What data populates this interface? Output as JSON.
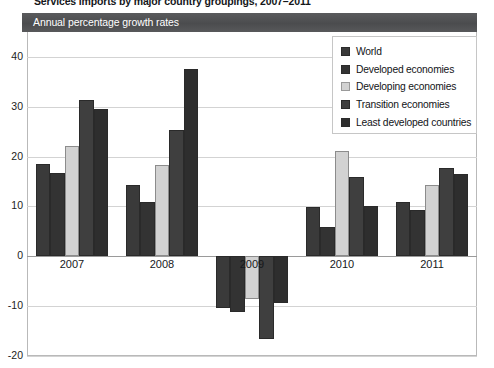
{
  "figure": {
    "caption": "Services imports by major country groupings, 2007–2011"
  },
  "panel": {
    "header_title": "Annual percentage growth rates",
    "header_color": "#4f5052"
  },
  "legend": {
    "position": "top-right",
    "entries": [
      {
        "label": "World",
        "color": "#3a3a3a",
        "swatch": "dark"
      },
      {
        "label": "Developed economies",
        "color": "#333333",
        "swatch": "dark"
      },
      {
        "label": "Developing economies",
        "color": "#d2d2d2",
        "swatch": "light"
      },
      {
        "label": "Transition economies",
        "color": "#3f3f3f",
        "swatch": "dark"
      },
      {
        "label": "Least developed countries",
        "color": "#2e2e2e",
        "swatch": "dark"
      }
    ]
  },
  "axes": {
    "y_ticks": [
      "40",
      "30",
      "20",
      "10",
      "0",
      "-10",
      "-20"
    ],
    "y_values": [
      40,
      30,
      20,
      10,
      0,
      -10,
      -20
    ],
    "x_ticks": [
      "2007",
      "2008",
      "2009",
      "2010",
      "2011"
    ]
  },
  "chart_data": {
    "type": "bar",
    "title": "Annual percentage growth rates",
    "subtitle": "Services imports by major country groupings, 2007–2011",
    "xlabel": "",
    "ylabel": "",
    "ylim": [
      -20,
      45
    ],
    "grid": true,
    "legend_position": "top-right",
    "categories": [
      "2007",
      "2008",
      "2009",
      "2010",
      "2011"
    ],
    "series": [
      {
        "name": "World",
        "color": "#3a3a3a",
        "values": [
          18.6,
          14.4,
          -10.3,
          9.8,
          10.9
        ]
      },
      {
        "name": "Developed economies",
        "color": "#333333",
        "values": [
          16.8,
          10.8,
          -11.2,
          5.9,
          9.3
        ]
      },
      {
        "name": "Developing economies",
        "color": "#d2d2d2",
        "values": [
          22.2,
          18.4,
          -8.6,
          21.1,
          14.3
        ]
      },
      {
        "name": "Transition economies",
        "color": "#3f3f3f",
        "values": [
          31.4,
          25.3,
          -16.6,
          16.0,
          17.7
        ]
      },
      {
        "name": "Least developed countries",
        "color": "#2e2e2e",
        "values": [
          29.5,
          37.6,
          -9.4,
          10.1,
          16.5
        ]
      }
    ]
  }
}
